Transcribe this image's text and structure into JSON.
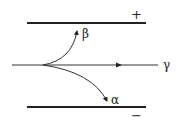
{
  "diagram": {
    "plates": {
      "top": {
        "sign": "+",
        "label": "positive-plate"
      },
      "bottom": {
        "sign": "−",
        "label": "negative-plate"
      }
    },
    "rays": [
      {
        "name": "beta",
        "symbol": "β",
        "deflection": "toward positive plate"
      },
      {
        "name": "gamma",
        "symbol": "γ",
        "deflection": "undeflected"
      },
      {
        "name": "alpha",
        "symbol": "α",
        "deflection": "toward negative plate"
      }
    ],
    "colors": {
      "line": "#222222",
      "background": "#ffffff"
    }
  }
}
